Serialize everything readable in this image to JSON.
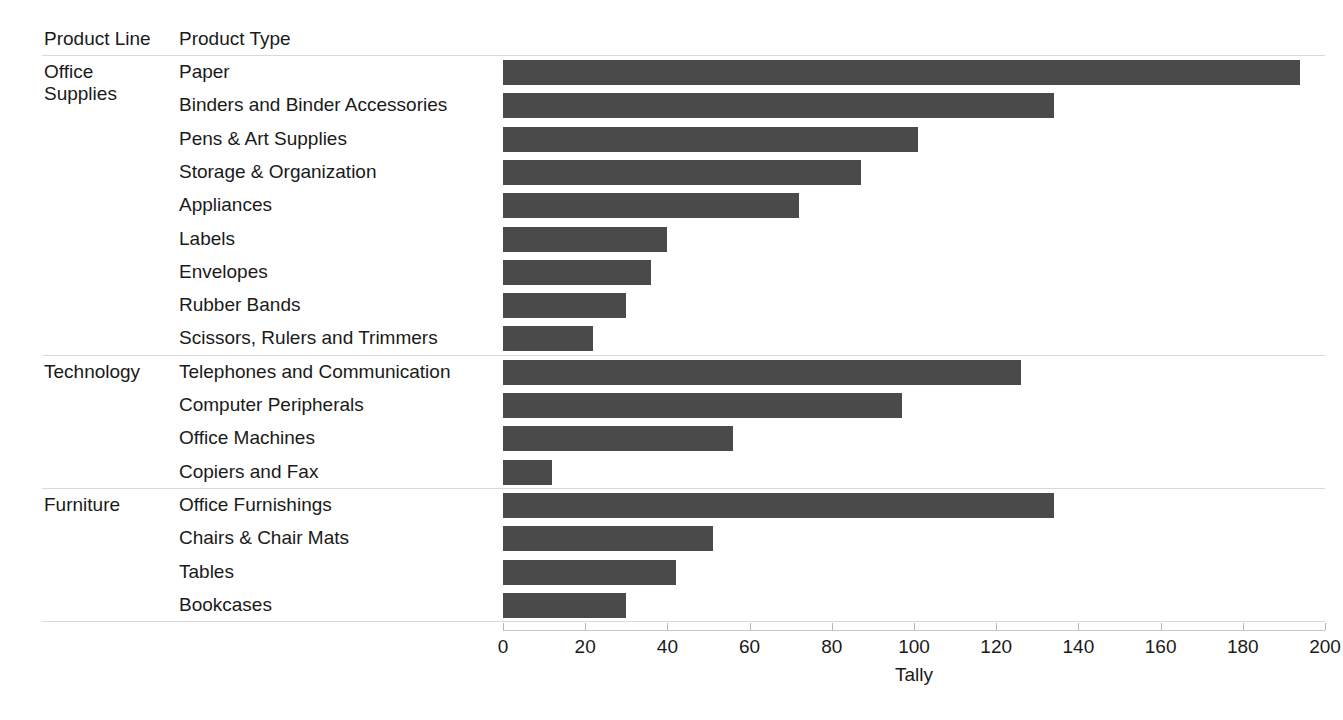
{
  "columns": {
    "product_line_header": "Product Line",
    "product_type_header": "Product Type"
  },
  "axis": {
    "title": "Tally",
    "ticks": [
      "0",
      "20",
      "40",
      "60",
      "80",
      "100",
      "120",
      "140",
      "160",
      "180",
      "200"
    ]
  },
  "colors": {
    "bar": "#4a4a4a",
    "grid": "#d9d9d9",
    "text": "#1a1a1a"
  },
  "groups": [
    {
      "product_line": "Office Supplies",
      "product_line_line1": "Office",
      "product_line_line2": "Supplies",
      "rows": [
        {
          "product_type": "Paper",
          "tally": 194
        },
        {
          "product_type": "Binders and Binder Accessories",
          "tally": 134
        },
        {
          "product_type": "Pens & Art Supplies",
          "tally": 101
        },
        {
          "product_type": "Storage & Organization",
          "tally": 87
        },
        {
          "product_type": "Appliances",
          "tally": 72
        },
        {
          "product_type": "Labels",
          "tally": 40
        },
        {
          "product_type": "Envelopes",
          "tally": 36
        },
        {
          "product_type": "Rubber Bands",
          "tally": 30
        },
        {
          "product_type": "Scissors, Rulers and Trimmers",
          "tally": 22
        }
      ]
    },
    {
      "product_line": "Technology",
      "product_line_line1": "Technology",
      "product_line_line2": "",
      "rows": [
        {
          "product_type": "Telephones and Communication",
          "tally": 126
        },
        {
          "product_type": "Computer Peripherals",
          "tally": 97
        },
        {
          "product_type": "Office Machines",
          "tally": 56
        },
        {
          "product_type": "Copiers and Fax",
          "tally": 12
        }
      ]
    },
    {
      "product_line": "Furniture",
      "product_line_line1": "Furniture",
      "product_line_line2": "",
      "rows": [
        {
          "product_type": "Office Furnishings",
          "tally": 134
        },
        {
          "product_type": "Chairs & Chair Mats",
          "tally": 51
        },
        {
          "product_type": "Tables",
          "tally": 42
        },
        {
          "product_type": "Bookcases",
          "tally": 30
        }
      ]
    }
  ],
  "chart_data": {
    "type": "bar",
    "orientation": "horizontal",
    "title": "",
    "xlabel": "Tally",
    "ylabel": "",
    "xlim": [
      0,
      200
    ],
    "xticks": [
      0,
      20,
      40,
      60,
      80,
      100,
      120,
      140,
      160,
      180,
      200
    ],
    "grid": false,
    "legend": "none",
    "group_field": "Product Line",
    "category_field": "Product Type",
    "categories": [
      "Paper",
      "Binders and Binder Accessories",
      "Pens & Art Supplies",
      "Storage & Organization",
      "Appliances",
      "Labels",
      "Envelopes",
      "Rubber Bands",
      "Scissors, Rulers and Trimmers",
      "Telephones and Communication",
      "Computer Peripherals",
      "Office Machines",
      "Copiers and Fax",
      "Office Furnishings",
      "Chairs & Chair Mats",
      "Tables",
      "Bookcases"
    ],
    "groups": [
      "Office Supplies",
      "Office Supplies",
      "Office Supplies",
      "Office Supplies",
      "Office Supplies",
      "Office Supplies",
      "Office Supplies",
      "Office Supplies",
      "Office Supplies",
      "Technology",
      "Technology",
      "Technology",
      "Technology",
      "Furniture",
      "Furniture",
      "Furniture",
      "Furniture"
    ],
    "values": [
      194,
      134,
      101,
      87,
      72,
      40,
      36,
      30,
      22,
      126,
      97,
      56,
      12,
      134,
      51,
      42,
      30
    ]
  }
}
